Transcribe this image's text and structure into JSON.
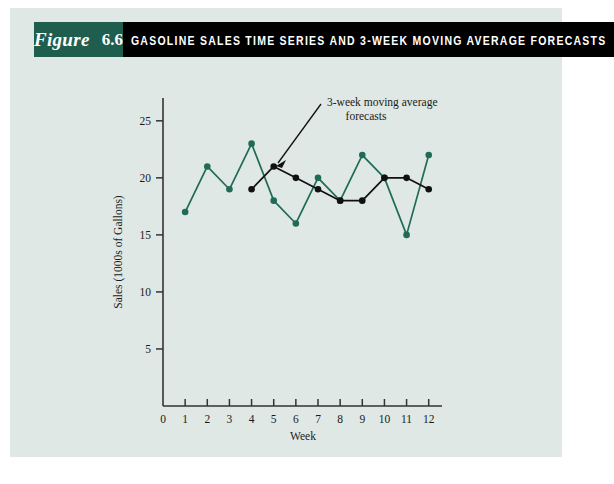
{
  "figure": {
    "label_word": "Figure",
    "number": "6.6",
    "title": "GASOLINE SALES TIME SERIES AND 3-WEEK MOVING AVERAGE FORECASTS",
    "tag_bg": "#1f5e4f",
    "title_bg": "#000000",
    "panel_bg": "#dfe8e4"
  },
  "chart_data": {
    "type": "line",
    "title": "GASOLINE SALES TIME SERIES AND 3-WEEK MOVING AVERAGE FORECASTS",
    "xlabel": "Week",
    "ylabel": "Sales (1000s of Gallons)",
    "x": [
      1,
      2,
      3,
      4,
      5,
      6,
      7,
      8,
      9,
      10,
      11,
      12
    ],
    "xticks": [
      0,
      1,
      2,
      3,
      4,
      5,
      6,
      7,
      8,
      9,
      10,
      11,
      12
    ],
    "yticks": [
      5,
      10,
      15,
      20,
      25
    ],
    "xlim": [
      0,
      12.6
    ],
    "ylim": [
      0,
      27
    ],
    "grid": false,
    "legend": "none",
    "series": [
      {
        "name": "Gasoline sales time series",
        "color": "#1f6b58",
        "x": [
          1,
          2,
          3,
          4,
          5,
          6,
          7,
          8,
          9,
          10,
          11,
          12
        ],
        "values": [
          17,
          21,
          19,
          23,
          18,
          16,
          20,
          18,
          22,
          20,
          15,
          22
        ]
      },
      {
        "name": "3-week moving average forecasts",
        "color": "#111111",
        "x": [
          4,
          5,
          6,
          7,
          8,
          9,
          10,
          11,
          12
        ],
        "values": [
          19,
          21,
          20,
          19,
          18,
          18,
          20,
          20,
          19
        ]
      }
    ],
    "annotations": [
      {
        "name": "forecast-annotation",
        "line1": "3-week moving average",
        "line2": "forecasts",
        "points_to_x": 5,
        "points_to_y": 21
      }
    ]
  }
}
